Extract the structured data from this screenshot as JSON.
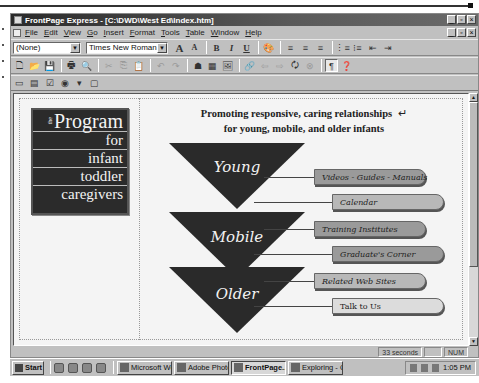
{
  "window": {
    "title": "FrontPage Express - [C:\\DWD\\West Ed\\Index.htm]",
    "controls": [
      "_",
      "▫",
      "×"
    ]
  },
  "menubar": {
    "items": [
      "File",
      "Edit",
      "View",
      "Go",
      "Insert",
      "Format",
      "Tools",
      "Table",
      "Window",
      "Help"
    ]
  },
  "format_toolbar": {
    "style_value": "(None)",
    "font_value": "Times New Roman",
    "grow_font": "A",
    "shrink_font": "A",
    "bold": "B",
    "italic": "I",
    "underline": "U",
    "text_color": "🎨",
    "align_left": "≡",
    "align_center": "≡",
    "align_right": "≡",
    "numbered_list": "⋮≡",
    "bulleted_list": "⁝≡",
    "decrease_indent": "⇤",
    "increase_indent": "⇥"
  },
  "standard_toolbar": {
    "icons": {
      "new": "🗋",
      "open": "📂",
      "save": "💾",
      "print": "🖶",
      "print_preview": "🔍",
      "cut": "✂",
      "copy": "⎘",
      "paste": "📋",
      "undo": "↶",
      "redo": "↷",
      "web_bot": "☗",
      "table": "▦",
      "image": "🖼",
      "hyperlink": "🔗",
      "back": "⇦",
      "forward": "⇨",
      "refresh": "🗘",
      "stop": "⊗",
      "show_all": "¶",
      "help": "❓"
    }
  },
  "forms_toolbar": {
    "icons": {
      "one_line_text": "▭",
      "scrolling_text": "▤",
      "checkbox": "☑",
      "radio": "◉",
      "dropdown": "▾",
      "push_button": "▢"
    }
  },
  "page": {
    "logo": {
      "the": "the",
      "lines": [
        "Program",
        "for",
        "infant",
        "toddler",
        "caregivers"
      ]
    },
    "headline_line1": "Promoting responsive, caring relationships",
    "headline_line2": "for young, mobile, and older infants",
    "paragraph_mark": "↵",
    "groups": [
      {
        "label": "Young",
        "links": [
          "Videos - Guides - Manuals",
          "Calendar"
        ]
      },
      {
        "label": "Mobile",
        "links": [
          "Training Institutes",
          "Graduate's Corner"
        ]
      },
      {
        "label": "Older",
        "links": [
          "Related Web Sites",
          "Talk to Us"
        ]
      }
    ]
  },
  "statusbar": {
    "load_time": "33 seconds",
    "num_lock": "NUM"
  },
  "taskbar": {
    "start": "Start",
    "tasks": [
      {
        "label": "Microsoft Wo...",
        "active": false
      },
      {
        "label": "Adobe Photo...",
        "active": false
      },
      {
        "label": "FrontPage...",
        "active": true
      },
      {
        "label": "Exploring - C...",
        "active": false
      }
    ],
    "clock": "1:05 PM"
  },
  "colors": {
    "triangle": "#2a2a2a",
    "pill_dark": "#9a9a9a",
    "pill_light": "#dcdcdc",
    "logo_bg": "#2b2b2b",
    "chrome": "#c0c0c0"
  }
}
